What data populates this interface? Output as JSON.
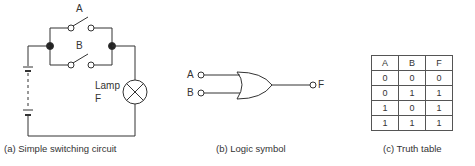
{
  "circuit": {
    "switch_a_label": "A",
    "switch_b_label": "B",
    "lamp_label_1": "Lamp",
    "lamp_label_2": "F",
    "caption": "(a) Simple switching circuit"
  },
  "logic_symbol": {
    "input_a": "A",
    "input_b": "B",
    "output": "F",
    "gate_type": "OR",
    "caption": "(b) Logic symbol"
  },
  "truth_table": {
    "headers": [
      "A",
      "B",
      "F"
    ],
    "rows": [
      [
        "0",
        "0",
        "0"
      ],
      [
        "0",
        "1",
        "1"
      ],
      [
        "1",
        "0",
        "1"
      ],
      [
        "1",
        "1",
        "1"
      ]
    ],
    "caption": "(c) Truth table"
  }
}
